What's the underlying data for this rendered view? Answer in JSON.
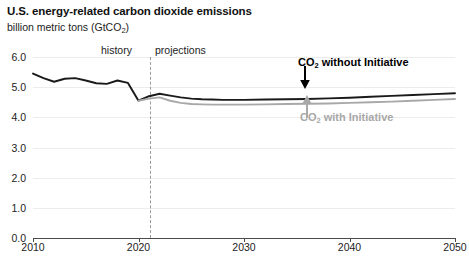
{
  "header": {
    "title": "U.S. energy-related carbon dioxide emissions",
    "subtitle_main": "billion metric tons (GtCO",
    "subtitle_sub": "2",
    "subtitle_close": ")"
  },
  "annotations": {
    "history": "history",
    "projections": "projections",
    "without_prefix": "CO",
    "without_sub": "2",
    "without_suffix": " without Initiative",
    "with_prefix": "CO",
    "with_sub": "2",
    "with_suffix": " with Initiative"
  },
  "colors": {
    "without_initiative": "#1a1a1a",
    "with_initiative": "#a8a8a8",
    "gridline": "#ececed",
    "axis": "#4a4a4a",
    "divider": "#9a9a9a"
  },
  "chart_data": {
    "type": "line",
    "title": "U.S. energy-related carbon dioxide emissions",
    "subtitle": "billion metric tons (GtCO2)",
    "xlabel": "",
    "ylabel": "billion metric tons (GtCO2)",
    "xlim": [
      2010,
      2050
    ],
    "ylim": [
      0.0,
      6.0
    ],
    "yticks": [
      "0.0",
      "1.0",
      "2.0",
      "3.0",
      "4.0",
      "5.0",
      "6.0"
    ],
    "ytick_values": [
      0.0,
      1.0,
      2.0,
      3.0,
      4.0,
      5.0,
      6.0
    ],
    "xticks": [
      "2010",
      "2020",
      "2030",
      "2040",
      "2050"
    ],
    "xtick_values": [
      2010,
      2020,
      2030,
      2040,
      2050
    ],
    "grid": true,
    "legend": "annotations on plot",
    "history_projection_split": 2020,
    "series": [
      {
        "name": "CO2 without Initiative",
        "color": "#1a1a1a",
        "x": [
          2010,
          2011,
          2012,
          2013,
          2014,
          2015,
          2016,
          2017,
          2018,
          2019,
          2020,
          2021,
          2022,
          2023,
          2024,
          2025,
          2026,
          2027,
          2028,
          2029,
          2030,
          2032,
          2034,
          2036,
          2038,
          2040,
          2042,
          2044,
          2046,
          2048,
          2050
        ],
        "values": [
          5.45,
          5.3,
          5.18,
          5.28,
          5.3,
          5.22,
          5.13,
          5.11,
          5.22,
          5.14,
          4.55,
          4.7,
          4.78,
          4.72,
          4.66,
          4.62,
          4.6,
          4.59,
          4.58,
          4.58,
          4.58,
          4.59,
          4.6,
          4.61,
          4.63,
          4.65,
          4.68,
          4.71,
          4.74,
          4.77,
          4.8
        ]
      },
      {
        "name": "CO2 with Initiative",
        "color": "#a8a8a8",
        "x": [
          2020,
          2021,
          2022,
          2023,
          2024,
          2025,
          2026,
          2027,
          2028,
          2029,
          2030,
          2032,
          2034,
          2036,
          2038,
          2040,
          2042,
          2044,
          2046,
          2048,
          2050
        ],
        "values": [
          4.55,
          4.62,
          4.66,
          4.55,
          4.48,
          4.44,
          4.43,
          4.42,
          4.42,
          4.42,
          4.42,
          4.43,
          4.44,
          4.45,
          4.46,
          4.48,
          4.5,
          4.52,
          4.55,
          4.58,
          4.61
        ]
      }
    ]
  }
}
